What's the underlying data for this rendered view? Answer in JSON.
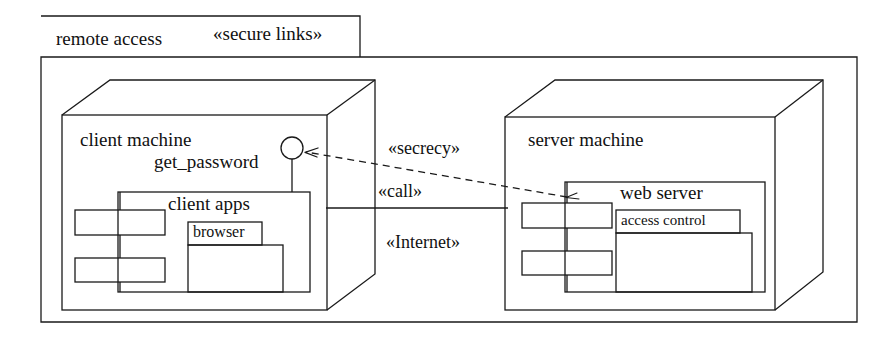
{
  "diagram": {
    "kind": "uml-deployment-diagram",
    "package": {
      "name": "remote access",
      "stereotype": "«secure links»"
    },
    "nodes": [
      {
        "id": "client-machine",
        "name": "client machine",
        "interface": {
          "name": "get_password",
          "icon": "lollipop-interface-icon"
        },
        "component": {
          "name": "client apps",
          "subcomponent": {
            "name": "browser"
          }
        }
      },
      {
        "id": "server-machine",
        "name": "server machine",
        "component": {
          "name": "web server",
          "subcomponent": {
            "name": "access control"
          }
        }
      }
    ],
    "connections": [
      {
        "id": "secrecy-dependency",
        "stereotype": "«secrecy»",
        "style": "dashed-arrow",
        "from": "server-machine",
        "to": "client-machine"
      },
      {
        "id": "call-association",
        "stereotype": "«call»",
        "style": "solid-line"
      },
      {
        "id": "internet-link",
        "stereotype": "«Internet»",
        "style": "label-only"
      }
    ],
    "colors": {
      "stroke": "#1a1a1a",
      "text": "#111111",
      "background": "#ffffff"
    }
  }
}
